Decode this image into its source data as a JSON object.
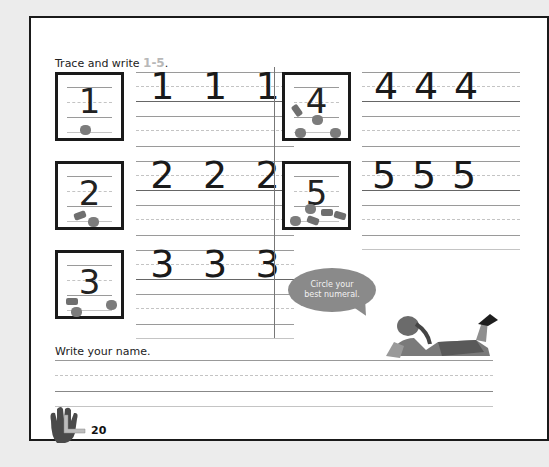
{
  "worksheet": {
    "instruction_prefix": "Trace and write ",
    "instruction_range": "1-5",
    "instruction_suffix": ".",
    "exercises": [
      {
        "numeral": "1",
        "model": "1",
        "trace": [
          "1",
          "1",
          "1"
        ],
        "counters": 1
      },
      {
        "numeral": "2",
        "model": "2",
        "trace": [
          "2",
          "2",
          "2"
        ],
        "counters": 2
      },
      {
        "numeral": "3",
        "model": "3",
        "trace": [
          "3",
          "3",
          "3"
        ],
        "counters": 3
      },
      {
        "numeral": "4",
        "model": "4",
        "trace": [
          "4",
          "4",
          "4"
        ],
        "counters": 4
      },
      {
        "numeral": "5",
        "model": "5",
        "trace": [
          "5",
          "5",
          "5"
        ],
        "counters": 5
      }
    ],
    "speech_bubble": "Circle your best numeral.",
    "name_prompt": "Write your name.",
    "page_number": "20",
    "colors": {
      "range_text": "#b8b8b8",
      "bubble": "#8a8a8a",
      "border": "#1a1a1a"
    }
  }
}
